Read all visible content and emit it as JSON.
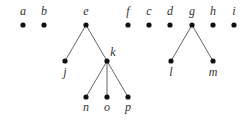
{
  "diagram": {
    "type": "forest",
    "colors": {
      "node": "#111111",
      "edge": "#666666",
      "label": "#333333",
      "background": "#ffffff"
    },
    "nodes": [
      {
        "id": "a",
        "label": "a",
        "x": 23,
        "y": 25,
        "lx": 23,
        "ly": 15
      },
      {
        "id": "b",
        "label": "b",
        "x": 44,
        "y": 25,
        "lx": 44,
        "ly": 15
      },
      {
        "id": "e",
        "label": "e",
        "x": 86,
        "y": 25,
        "lx": 86,
        "ly": 15
      },
      {
        "id": "f",
        "label": "f",
        "x": 128,
        "y": 25,
        "lx": 128,
        "ly": 15
      },
      {
        "id": "c",
        "label": "c",
        "x": 149,
        "y": 25,
        "lx": 149,
        "ly": 15
      },
      {
        "id": "d",
        "label": "d",
        "x": 170,
        "y": 25,
        "lx": 170,
        "ly": 15
      },
      {
        "id": "g",
        "label": "g",
        "x": 192,
        "y": 25,
        "lx": 192,
        "ly": 15
      },
      {
        "id": "h",
        "label": "h",
        "x": 213,
        "y": 25,
        "lx": 213,
        "ly": 15
      },
      {
        "id": "i",
        "label": "i",
        "x": 234,
        "y": 25,
        "lx": 234,
        "ly": 15
      },
      {
        "id": "j",
        "label": "j",
        "x": 65,
        "y": 61,
        "lx": 65,
        "ly": 76
      },
      {
        "id": "k",
        "label": "k",
        "x": 107,
        "y": 61,
        "lx": 113,
        "ly": 56
      },
      {
        "id": "n",
        "label": "n",
        "x": 86,
        "y": 97,
        "lx": 86,
        "ly": 111
      },
      {
        "id": "o",
        "label": "o",
        "x": 107,
        "y": 97,
        "lx": 107,
        "ly": 111
      },
      {
        "id": "p",
        "label": "p",
        "x": 128,
        "y": 97,
        "lx": 128,
        "ly": 111
      },
      {
        "id": "l",
        "label": "l",
        "x": 171,
        "y": 61,
        "lx": 171,
        "ly": 76
      },
      {
        "id": "m",
        "label": "m",
        "x": 213,
        "y": 61,
        "lx": 213,
        "ly": 76
      }
    ],
    "edges": [
      {
        "from": "e",
        "to": "j"
      },
      {
        "from": "e",
        "to": "k"
      },
      {
        "from": "k",
        "to": "n"
      },
      {
        "from": "k",
        "to": "o"
      },
      {
        "from": "k",
        "to": "p"
      },
      {
        "from": "g",
        "to": "l"
      },
      {
        "from": "g",
        "to": "m"
      }
    ]
  }
}
